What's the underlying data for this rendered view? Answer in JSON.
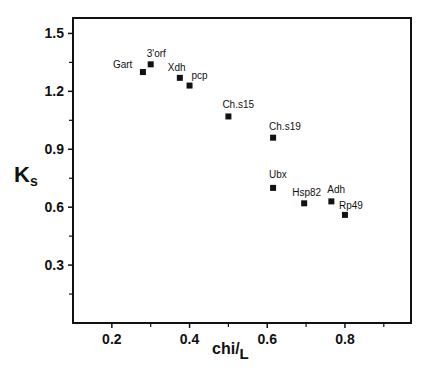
{
  "chart_data": {
    "type": "scatter",
    "title": "",
    "xlabel": "chi/L",
    "xlabel_main": "chi",
    "xlabel_sub": "L",
    "ylabel": "Ks",
    "ylabel_main": "K",
    "ylabel_sub": "s",
    "xlim": [
      0.1,
      0.97
    ],
    "ylim": [
      0.0,
      1.58
    ],
    "x_ticks": [
      0.2,
      0.4,
      0.6,
      0.8
    ],
    "x_tick_labels": [
      "0.2",
      "0.4",
      "0.6",
      "0.8"
    ],
    "x_minor_ticks": [
      0.3,
      0.5,
      0.7,
      0.9
    ],
    "y_ticks": [
      0.3,
      0.6,
      0.9,
      1.2,
      1.5
    ],
    "y_tick_labels": [
      "0.3",
      "0.6",
      "0.9",
      "1.2",
      "1.5"
    ],
    "y_minor_ticks": [
      0.15,
      0.45,
      0.75,
      1.05,
      1.35
    ],
    "grid": false,
    "legend": null,
    "marker": "square",
    "marker_color": "#111111",
    "points": [
      {
        "label": "Gart",
        "x": 0.28,
        "y": 1.3,
        "label_dx": -30,
        "label_dy": -4
      },
      {
        "label": "3'orf",
        "x": 0.3,
        "y": 1.34,
        "label_dx": -4,
        "label_dy": -7
      },
      {
        "label": "Xdh",
        "x": 0.375,
        "y": 1.27,
        "label_dx": -12,
        "label_dy": -7
      },
      {
        "label": "pcp",
        "x": 0.4,
        "y": 1.23,
        "label_dx": 2,
        "label_dy": -7
      },
      {
        "label": "Ch.s15",
        "x": 0.5,
        "y": 1.07,
        "label_dx": -6,
        "label_dy": -8
      },
      {
        "label": "Ch.s19",
        "x": 0.615,
        "y": 0.96,
        "label_dx": -4,
        "label_dy": -8
      },
      {
        "label": "Ubx",
        "x": 0.615,
        "y": 0.7,
        "label_dx": -4,
        "label_dy": -10
      },
      {
        "label": "Hsp82",
        "x": 0.695,
        "y": 0.62,
        "label_dx": -12,
        "label_dy": -7
      },
      {
        "label": "Adh",
        "x": 0.765,
        "y": 0.63,
        "label_dx": -4,
        "label_dy": -8
      },
      {
        "label": "Rp49",
        "x": 0.8,
        "y": 0.56,
        "label_dx": -6,
        "label_dy": -6
      }
    ]
  }
}
